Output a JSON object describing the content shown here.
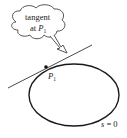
{
  "diagram": {
    "callout": {
      "line1": "tangent",
      "line2_prefix": "at ",
      "line2_var": "P",
      "line2_sub": "1"
    },
    "point": {
      "var": "P",
      "sub": "1"
    },
    "curve_label": {
      "var": "s",
      "rest": " = 0"
    },
    "colors": {
      "stroke": "#1a1a1a",
      "background": "#ffffff"
    }
  }
}
